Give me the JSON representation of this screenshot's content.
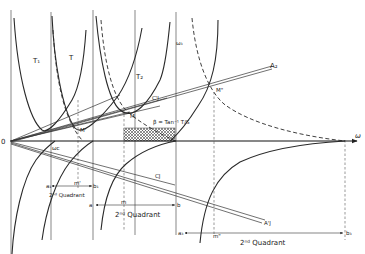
{
  "diagram": {
    "origin_label": "0",
    "axis_label": "ω",
    "curve_labels": {
      "t1": "T₁",
      "t": "T",
      "t2": "T₂"
    },
    "ray_labels": {
      "a2_upper": "A₂",
      "c_j_upper": "C'J",
      "c_j_lower": "CJ",
      "a_j_lower": "A'J"
    },
    "point_labels": {
      "m_prime": "M'",
      "m": "M",
      "m_double": "M\"",
      "omega_c": "ωc",
      "omega3": "ω₃",
      "m_small_1": "m'",
      "m_small_2": "m",
      "m_small_3": "m\""
    },
    "beta_annotation": "β = Tan⁻¹ T/S",
    "quadrant_segments": [
      {
        "start": "a₁",
        "end": "b₁",
        "label": "2ⁿᵈ Quadrant"
      },
      {
        "start": "a",
        "end": "b",
        "label": "2ⁿᵈ Quadrant"
      },
      {
        "start": "a₃",
        "end": "b₃",
        "label": "2ⁿᵈ Quadrant"
      }
    ],
    "colors": {
      "ink": "#2a2a2a",
      "background": "#ffffff",
      "hatch": "#555555"
    }
  }
}
